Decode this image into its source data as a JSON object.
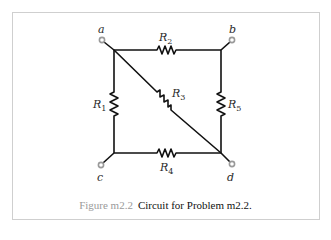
{
  "figure": {
    "number_label": "Figure m2.2",
    "caption_text": "Circuit for Problem m2.2."
  },
  "nodes": {
    "a": "a",
    "b": "b",
    "c": "c",
    "d": "d"
  },
  "resistors": {
    "r1": {
      "symbol": "R",
      "sub": "1"
    },
    "r2": {
      "symbol": "R",
      "sub": "2"
    },
    "r3": {
      "symbol": "R",
      "sub": "3"
    },
    "r4": {
      "symbol": "R",
      "sub": "4"
    },
    "r5": {
      "symbol": "R",
      "sub": "5"
    }
  },
  "colors": {
    "wire": "#111111",
    "terminal": "#9a9a9a",
    "border": "#cfcfcf",
    "figure_label": "#9a9a9a"
  }
}
